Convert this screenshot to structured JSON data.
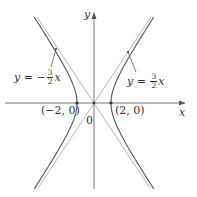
{
  "diagram": {
    "type": "hyperbola",
    "equation_shape": "x^2/4 - y^2/9 = 1",
    "axes": {
      "x_label": "x",
      "y_label": "y",
      "origin_label": "0"
    },
    "vertices": [
      {
        "label": "(−2, 0)",
        "x": -2,
        "y": 0
      },
      {
        "label": "(2, 0)",
        "x": 2,
        "y": 0
      }
    ],
    "asymptotes": [
      {
        "label_prefix": "y = −",
        "num": "3",
        "den": "2",
        "var": "x",
        "slope": -1.5
      },
      {
        "label_prefix": "y = ",
        "num": "3",
        "den": "2",
        "var": "x",
        "slope": 1.5
      }
    ],
    "colors": {
      "curve": "#555555",
      "asymptote": "#b0b0b0",
      "axis": "#555555",
      "text": "#333333"
    }
  }
}
